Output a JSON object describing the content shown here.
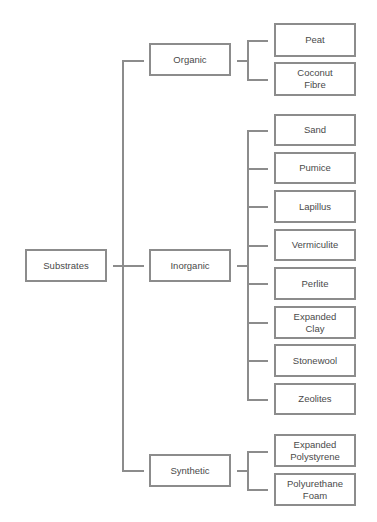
{
  "diagram": {
    "type": "tree",
    "root": {
      "id": "substrates",
      "label": "Substrates"
    },
    "categories": [
      {
        "id": "organic",
        "label": "Organic",
        "children": [
          {
            "label": "Peat"
          },
          {
            "label": "Coconut Fibre"
          }
        ]
      },
      {
        "id": "inorganic",
        "label": "Inorganic",
        "children": [
          {
            "label": "Sand"
          },
          {
            "label": "Pumice"
          },
          {
            "label": "Lapillus"
          },
          {
            "label": "Vermiculite"
          },
          {
            "label": "Perlite"
          },
          {
            "label": "Expanded Clay"
          },
          {
            "label": "Stonewool"
          },
          {
            "label": "Zeolites"
          }
        ]
      },
      {
        "id": "synthetic",
        "label": "Synthetic",
        "children": [
          {
            "label": "Expanded Polystyrene"
          },
          {
            "label": "Polyurethane Foam"
          }
        ]
      }
    ]
  },
  "colors": {
    "border": "#8c8c8c",
    "text": "#4a4a4a",
    "background": "#ffffff"
  }
}
